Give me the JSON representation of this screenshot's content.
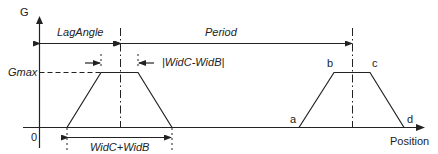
{
  "axes": {
    "y_label": "G",
    "x_label": "Position",
    "origin_label": "0"
  },
  "labels": {
    "gmax": "Gmax",
    "lag_angle": "LagAngle",
    "period": "Period",
    "abs_width_diff": "|WidC-WidB|",
    "width_sum": "WidC+WidB"
  },
  "points": {
    "a": "a",
    "b": "b",
    "c": "c",
    "d": "d"
  },
  "colors": {
    "line": "#222222",
    "background": "#ffffff"
  }
}
